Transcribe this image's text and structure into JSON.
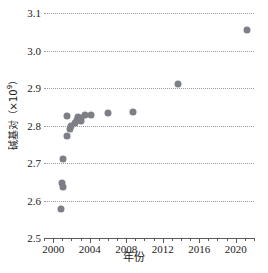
{
  "chart_data": {
    "type": "scatter",
    "title": "",
    "xlabel": "年份",
    "ylabel": "碱基对（×10⁹）",
    "ylabel_base": "碱基对（×10",
    "ylabel_exp": "9",
    "ylabel_tail": "）",
    "xlim": [
      1999.0,
      2022.0
    ],
    "ylim": [
      2.5,
      3.1
    ],
    "grid": true,
    "legend": "none",
    "marker_color": "#7d7f86",
    "gridline_color": "#9a9a9a",
    "axis_color": "#5a5a5a",
    "y_ticks": [
      2.5,
      2.6,
      2.7,
      2.8,
      2.9,
      3.0,
      3.1
    ],
    "y_tick_labels": [
      "2.5",
      "2.6",
      "2.7",
      "2.8",
      "2.9",
      "3.0",
      "3.1"
    ],
    "x_major_ticks": [
      2000,
      2004,
      2008,
      2012,
      2016,
      2020
    ],
    "x_major_tick_labels": [
      "2000",
      "2004",
      "2008",
      "2012",
      "2016",
      "2020"
    ],
    "x_minor_tick_step": 1,
    "points": [
      {
        "x": 2000.9,
        "y": 2.578
      },
      {
        "x": 2001.0,
        "y": 2.648
      },
      {
        "x": 2001.1,
        "y": 2.636
      },
      {
        "x": 2001.1,
        "y": 2.712
      },
      {
        "x": 2001.5,
        "y": 2.772
      },
      {
        "x": 2001.5,
        "y": 2.826
      },
      {
        "x": 2001.9,
        "y": 2.79
      },
      {
        "x": 2002.0,
        "y": 2.799
      },
      {
        "x": 2002.4,
        "y": 2.808
      },
      {
        "x": 2002.6,
        "y": 2.816
      },
      {
        "x": 2002.7,
        "y": 2.823
      },
      {
        "x": 2003.0,
        "y": 2.812
      },
      {
        "x": 2003.1,
        "y": 2.82
      },
      {
        "x": 2003.5,
        "y": 2.827
      },
      {
        "x": 2004.2,
        "y": 2.829
      },
      {
        "x": 2006.0,
        "y": 2.833
      },
      {
        "x": 2008.8,
        "y": 2.836
      },
      {
        "x": 2013.7,
        "y": 2.911
      },
      {
        "x": 2021.2,
        "y": 3.055
      }
    ]
  }
}
